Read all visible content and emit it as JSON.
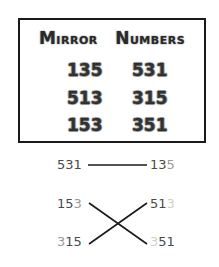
{
  "card": {
    "title": "Mirror Numbers",
    "title_parts": [
      {
        "cap": "M",
        "rest": "irror"
      },
      {
        "cap": "N",
        "rest": "umbers"
      }
    ],
    "rows": [
      {
        "left": "135",
        "right": "531"
      },
      {
        "left": "513",
        "right": "315"
      },
      {
        "left": "153",
        "right": "351"
      }
    ]
  },
  "matching": {
    "pairs": [
      {
        "left": "531",
        "right": "135",
        "left_digits": [
          {
            "d": "5",
            "tone": "normal"
          },
          {
            "d": "3",
            "tone": "normal"
          },
          {
            "d": "1",
            "tone": "normal"
          }
        ],
        "right_digits": [
          {
            "d": "1",
            "tone": "normal"
          },
          {
            "d": "3",
            "tone": "normal"
          },
          {
            "d": "5",
            "tone": "faint"
          }
        ]
      },
      {
        "left": "153",
        "right": "513",
        "left_digits": [
          {
            "d": "1",
            "tone": "normal"
          },
          {
            "d": "5",
            "tone": "normal"
          },
          {
            "d": "3",
            "tone": "faint"
          }
        ],
        "right_digits": [
          {
            "d": "5",
            "tone": "normal"
          },
          {
            "d": "1",
            "tone": "normal"
          },
          {
            "d": "3",
            "tone": "vfaint"
          }
        ]
      },
      {
        "left": "315",
        "right": "351",
        "left_digits": [
          {
            "d": "3",
            "tone": "faint"
          },
          {
            "d": "1",
            "tone": "normal"
          },
          {
            "d": "5",
            "tone": "normal"
          }
        ],
        "right_digits": [
          {
            "d": "3",
            "tone": "vfaint"
          },
          {
            "d": "5",
            "tone": "normal"
          },
          {
            "d": "1",
            "tone": "normal"
          }
        ]
      }
    ],
    "connections": [
      {
        "from": "531",
        "to": "135",
        "shape": "horizontal"
      },
      {
        "from": "153",
        "to": "351",
        "shape": "diagonal-down"
      },
      {
        "from": "315",
        "to": "513",
        "shape": "diagonal-up"
      }
    ]
  },
  "colors": {
    "border": "#1a1a1a",
    "text": "#4a4a4a",
    "faint": "#9a9a9a",
    "very_faint": "#cfcfcf",
    "line": "#1a1a1a"
  }
}
